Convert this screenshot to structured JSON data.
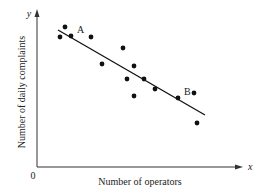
{
  "chart_data": {
    "type": "scatter",
    "title": "",
    "xlabel": "Number of operators",
    "ylabel": "Number of daily complaints",
    "x_axis_symbol": "x",
    "y_axis_symbol": "y",
    "origin_label": "0",
    "grid": false,
    "legend": null,
    "ticks": "none",
    "points": [
      {
        "x": 23,
        "y": 130
      },
      {
        "x": 28,
        "y": 140
      },
      {
        "x": 34,
        "y": 131
      },
      {
        "x": 54,
        "y": 130
      },
      {
        "x": 65,
        "y": 103
      },
      {
        "x": 86,
        "y": 119
      },
      {
        "x": 90,
        "y": 88
      },
      {
        "x": 97,
        "y": 101
      },
      {
        "x": 97,
        "y": 71
      },
      {
        "x": 107,
        "y": 88
      },
      {
        "x": 118,
        "y": 78
      },
      {
        "x": 141,
        "y": 69
      },
      {
        "x": 157,
        "y": 74
      },
      {
        "x": 160,
        "y": 44
      }
    ],
    "regression_line": {
      "x1": 21,
      "y1": 137,
      "x2": 168,
      "y2": 52
    },
    "annotations": [
      {
        "label": "A",
        "x": 34,
        "y": 131
      },
      {
        "label": "B",
        "x": 141,
        "y": 69
      }
    ],
    "colors": {
      "points": "#111111",
      "line": "#111111",
      "axes": "#333333"
    }
  }
}
